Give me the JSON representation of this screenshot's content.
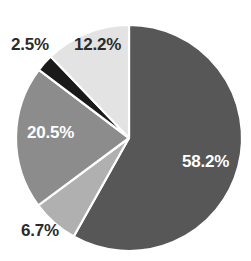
{
  "chart_data": {
    "type": "pie",
    "title": "",
    "subtitle": "",
    "xlabel": "",
    "ylabel": "",
    "legend": "none",
    "grid": false,
    "start_angle_deg": 0,
    "direction": "clockwise",
    "center": {
      "x": 129,
      "y": 138
    },
    "radius": 113,
    "separator_color": "#ffffff",
    "background": "#ffffff",
    "categories": [
      "58.2%",
      "6.7%",
      "20.5%",
      "2.5%",
      "12.2%"
    ],
    "values": [
      58.2,
      6.7,
      20.5,
      2.5,
      12.2
    ],
    "slices": [
      {
        "label": "58.2%",
        "value": 58.2,
        "color": "#575757",
        "label_color": "#ffffff",
        "label_position": "inside"
      },
      {
        "label": "6.7%",
        "value": 6.7,
        "color": "#b0b0b0",
        "label_color": "#2b2b2b",
        "label_position": "outside"
      },
      {
        "label": "20.5%",
        "value": 20.5,
        "color": "#8c8c8c",
        "label_color": "#ffffff",
        "label_position": "inside"
      },
      {
        "label": "2.5%",
        "value": 2.5,
        "color": "#1a1a1a",
        "label_color": "#2b2b2b",
        "label_position": "outside"
      },
      {
        "label": "12.2%",
        "value": 12.2,
        "color": "#e3e3e3",
        "label_color": "#2b2b2b",
        "label_position": "inside"
      }
    ]
  }
}
